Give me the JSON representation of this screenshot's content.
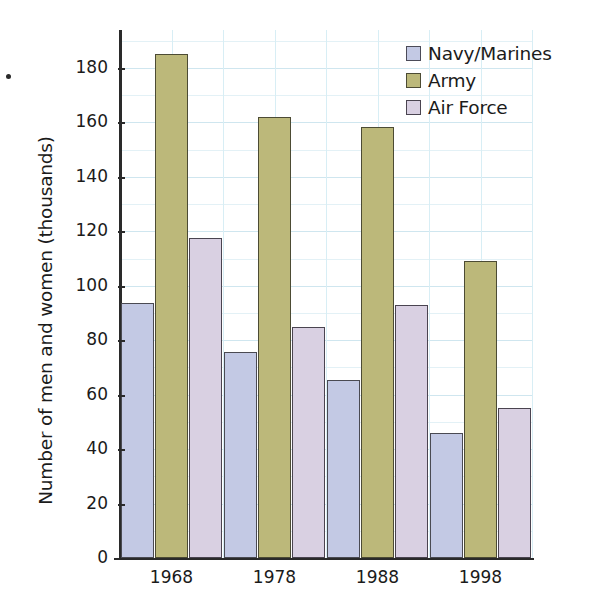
{
  "chart_data": {
    "type": "bar",
    "title": "",
    "xlabel": "",
    "ylabel": "Number of men and women (thousands)",
    "categories": [
      "1968",
      "1978",
      "1988",
      "1998"
    ],
    "series": [
      {
        "name": "Navy/Marines",
        "color": "#c3c9e4",
        "values": [
          93.5,
          75.5,
          65.5,
          46
        ]
      },
      {
        "name": "Army",
        "color": "#bcb87a",
        "values": [
          185,
          162,
          158.5,
          109
        ]
      },
      {
        "name": "Air Force",
        "color": "#d9d0e2",
        "values": [
          117.5,
          85,
          93,
          55
        ]
      }
    ],
    "ylim": [
      0,
      190
    ],
    "yticks": [
      0,
      20,
      40,
      60,
      80,
      100,
      120,
      140,
      160,
      180
    ],
    "ytick_labels": [
      "0",
      "20",
      "40",
      "60",
      "80",
      "100",
      "120",
      "140",
      "160",
      "180"
    ],
    "minor_tick_step": 10,
    "grid": true,
    "grid_color": "#cfe6ef",
    "legend_position": "top-right",
    "legend_entries": [
      "Navy/Marines",
      "Army",
      "Air Force"
    ]
  },
  "axis": {
    "y_title": "Number of men and women (thousands)"
  },
  "legend": {
    "items": [
      {
        "label": "Navy/Marines"
      },
      {
        "label": "Army"
      },
      {
        "label": "Air Force"
      }
    ]
  }
}
